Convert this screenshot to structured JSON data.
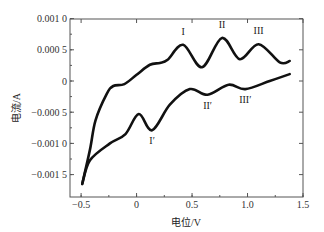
{
  "chart_data": {
    "type": "line",
    "title": "",
    "xlabel": "电位/V",
    "ylabel": "电流/A",
    "xlim": [
      -0.6,
      1.5
    ],
    "ylim": [
      -0.0018,
      0.001
    ],
    "grid": false,
    "legend": null,
    "x_ticks": [
      -0.5,
      0,
      0.5,
      1.0,
      1.5
    ],
    "x_tick_labels": [
      "−0.5",
      "0",
      "0.5",
      "1.0",
      "1.5"
    ],
    "y_ticks": [
      0.001,
      0.0005,
      0,
      -0.0005,
      -0.001,
      -0.0015
    ],
    "y_tick_labels": [
      "0.001 0",
      "0.000 5",
      "0",
      "−0.000 5",
      "−0.001 0",
      "−0.001 5"
    ],
    "series": [
      {
        "name": "anodic sweep",
        "x": [
          -0.49,
          -0.42,
          -0.37,
          -0.27,
          -0.21,
          -0.11,
          0.0,
          0.12,
          0.21,
          0.28,
          0.42,
          0.59,
          0.77,
          0.93,
          1.1,
          1.29,
          1.38
        ],
        "y": [
          -0.00165,
          -0.0011,
          -0.00063,
          -0.00021,
          -8e-05,
          -5e-05,
          0.0001,
          0.00026,
          0.00029,
          0.00034,
          0.00058,
          0.00022,
          0.00069,
          0.00035,
          0.00059,
          0.0003,
          0.00032
        ]
      },
      {
        "name": "cathodic sweep",
        "x": [
          -0.49,
          -0.42,
          -0.24,
          -0.1,
          0.02,
          0.14,
          0.3,
          0.48,
          0.64,
          0.83,
          0.98,
          1.2,
          1.38
        ],
        "y": [
          -0.00165,
          -0.00127,
          -0.001,
          -0.00085,
          -0.00053,
          -0.00079,
          -0.00038,
          -0.00013,
          -0.00022,
          -6e-05,
          -0.00013,
          0.0,
          0.00011
        ]
      }
    ],
    "annotations": [
      {
        "text": "I",
        "x": 0.42,
        "y": 0.00058,
        "dy": -10
      },
      {
        "text": "II",
        "x": 0.77,
        "y": 0.00069,
        "dy": -10
      },
      {
        "text": "III",
        "x": 1.1,
        "y": 0.00059,
        "dy": -10
      },
      {
        "text": "I′",
        "x": 0.14,
        "y": -0.00079,
        "dy": 14
      },
      {
        "text": "II′",
        "x": 0.64,
        "y": -0.00022,
        "dy": 14
      },
      {
        "text": "III′",
        "x": 0.98,
        "y": -0.00013,
        "dy": 14
      }
    ]
  },
  "style": {
    "line_color": "#111111",
    "axis_color": "#555555"
  }
}
